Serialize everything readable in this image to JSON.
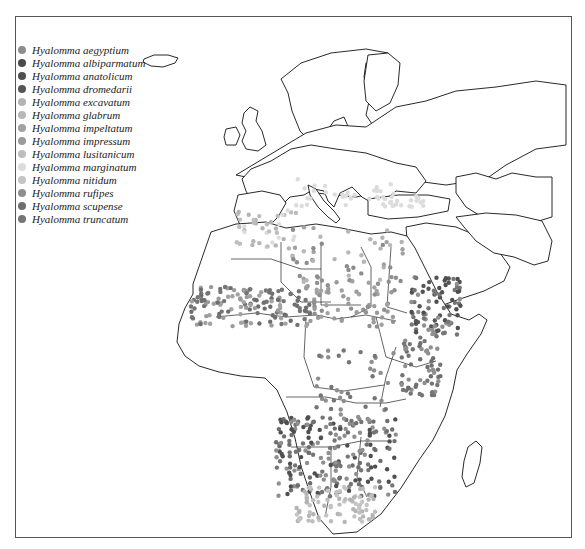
{
  "map": {
    "region": "Europe, Middle East and Africa",
    "legend": [
      {
        "label": "Hyalomma aegyptium",
        "color": "#8c8c8c"
      },
      {
        "label": "Hyalomma albiparmatum",
        "color": "#4a4a4a"
      },
      {
        "label": "Hyalomma anatolicum",
        "color": "#4f4f4f"
      },
      {
        "label": "Hyalomma dromedarii",
        "color": "#555555"
      },
      {
        "label": "Hyalomma excavatum",
        "color": "#b4b4b4"
      },
      {
        "label": "Hyalomma glabrum",
        "color": "#b8b8b8"
      },
      {
        "label": "Hyalomma impeltatum",
        "color": "#a2a2a2"
      },
      {
        "label": "Hyalomma impressum",
        "color": "#9a9a9a"
      },
      {
        "label": "Hyalomma lusitanicum",
        "color": "#bdbdbd"
      },
      {
        "label": "Hyalomma marginatum",
        "color": "#dcdcdc"
      },
      {
        "label": "Hyalomma nitidum",
        "color": "#c4c4c4"
      },
      {
        "label": "Hyalomma rufipes",
        "color": "#8f8f8f"
      },
      {
        "label": "Hyalomma scupense",
        "color": "#6e6e6e"
      },
      {
        "label": "Hyalomma truncatum",
        "color": "#757575"
      }
    ]
  }
}
